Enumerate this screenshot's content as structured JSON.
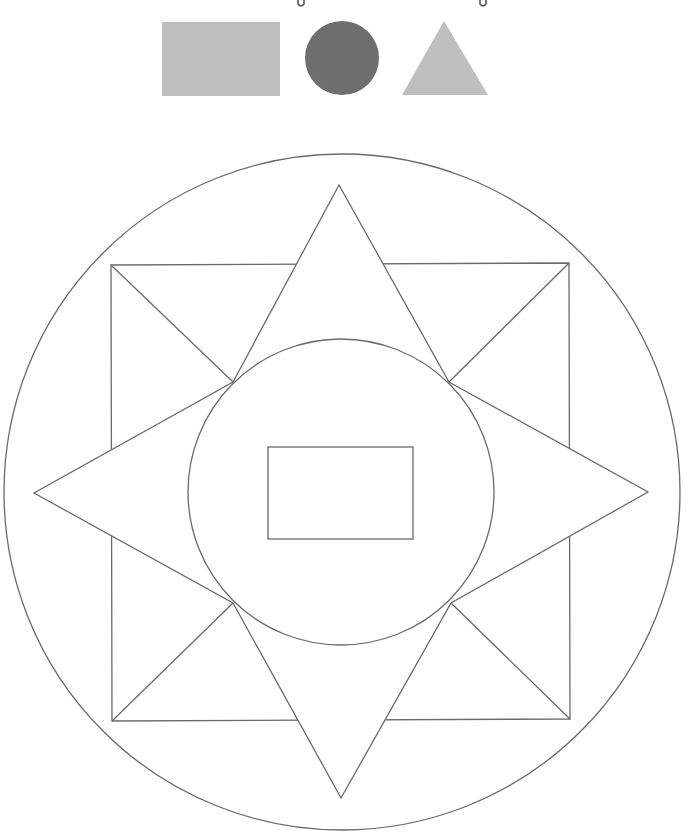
{
  "colors": {
    "background": "#ffffff",
    "stroke": "#6a6a6a",
    "legend_rect": "#bdbdbd",
    "legend_circle": "#6e6e6e",
    "legend_triangle": "#bfbfbf"
  },
  "legend": {
    "shapes": [
      {
        "type": "rectangle",
        "name": "gray-rectangle",
        "x": 162,
        "y": 22,
        "width": 118,
        "height": 74,
        "fill_key": "legend_rect"
      },
      {
        "type": "circle",
        "name": "dark-gray-circle",
        "cx": 342,
        "cy": 58,
        "r": 37,
        "fill_key": "legend_circle"
      },
      {
        "type": "triangle",
        "name": "gray-triangle",
        "points": [
          [
            444,
            21
          ],
          [
            402,
            95
          ],
          [
            488,
            95
          ]
        ],
        "fill_key": "legend_triangle"
      }
    ],
    "top_marks": [
      {
        "name": "hook-mark-left",
        "x": 301
      },
      {
        "name": "hook-mark-right",
        "x": 483
      }
    ]
  },
  "diagram": {
    "outer_circle": {
      "cx": 342,
      "cy": 492,
      "r": 338
    },
    "square": {
      "top_left": [
        111,
        265
      ],
      "top_right": [
        569,
        263
      ],
      "bottom_right": [
        570,
        719
      ],
      "bottom_left": [
        112,
        721
      ]
    },
    "star": {
      "outer_points": {
        "top": [
          339,
          185
        ],
        "right": [
          648,
          492
        ],
        "bottom": [
          341,
          798
        ],
        "left": [
          34,
          493
        ]
      },
      "inner_points": {
        "top_right": [
          449,
          382
        ],
        "bottom_right": [
          451,
          603
        ],
        "bottom_left": [
          233,
          603
        ],
        "top_left": [
          233,
          382
        ]
      }
    },
    "inner_circle": {
      "cx": 341,
      "cy": 492,
      "r": 153
    },
    "center_rectangle": {
      "x": 268,
      "y": 447,
      "width": 145,
      "height": 92
    }
  }
}
